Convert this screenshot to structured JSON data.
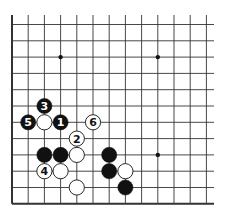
{
  "diagram": {
    "type": "go-board-fragment",
    "columns": 13,
    "rows": 12,
    "edges": [
      "left",
      "bottom"
    ],
    "colors": {
      "line": "#333333",
      "black": "#111111",
      "white": "#ffffff",
      "label_on_black": "#ffffff",
      "label_on_white": "#111111"
    },
    "star_points": [
      [
        3,
        2
      ],
      [
        9,
        2
      ],
      [
        9,
        8
      ]
    ],
    "stones": [
      {
        "col": 2,
        "row": 5,
        "color": "black",
        "label": "3"
      },
      {
        "col": 1,
        "row": 6,
        "color": "black",
        "label": "5"
      },
      {
        "col": 2,
        "row": 6,
        "color": "white",
        "label": ""
      },
      {
        "col": 3,
        "row": 6,
        "color": "black",
        "label": "1"
      },
      {
        "col": 5,
        "row": 6,
        "color": "white",
        "label": "6"
      },
      {
        "col": 4,
        "row": 7,
        "color": "white",
        "label": "2"
      },
      {
        "col": 2,
        "row": 8,
        "color": "black",
        "label": ""
      },
      {
        "col": 3,
        "row": 8,
        "color": "black",
        "label": ""
      },
      {
        "col": 4,
        "row": 8,
        "color": "white",
        "label": ""
      },
      {
        "col": 2,
        "row": 9,
        "color": "white",
        "label": "4"
      },
      {
        "col": 3,
        "row": 9,
        "color": "white",
        "label": ""
      },
      {
        "col": 4,
        "row": 10,
        "color": "white",
        "label": ""
      },
      {
        "col": 6,
        "row": 8,
        "color": "black",
        "label": ""
      },
      {
        "col": 6,
        "row": 9,
        "color": "black",
        "label": ""
      },
      {
        "col": 7,
        "row": 9,
        "color": "white",
        "label": ""
      },
      {
        "col": 7,
        "row": 10,
        "color": "black",
        "label": ""
      }
    ]
  }
}
